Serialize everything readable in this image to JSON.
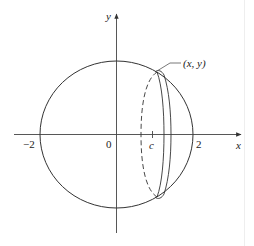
{
  "diagram": {
    "type": "circle-with-slice",
    "axes": {
      "x_label": "x",
      "y_label": "y"
    },
    "ticks": {
      "neg_two": "−2",
      "zero": "0",
      "c": "c",
      "two": "2"
    },
    "point_label": "(x, y)",
    "colors": {
      "stroke": "#333333",
      "background": "#ffffff"
    }
  }
}
